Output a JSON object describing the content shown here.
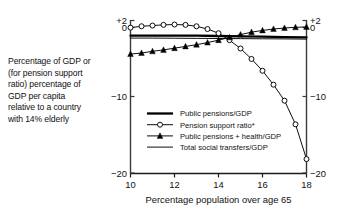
{
  "caption": {
    "lines": [
      "Percentage of GDP or",
      "(for pension support",
      "ratio) percentage of",
      "GDP per capita",
      "relative to a country",
      "with 14% elderly"
    ]
  },
  "chart_data": {
    "type": "line",
    "title": "",
    "subtitle": "",
    "xlabel": "Percentage population over age 65",
    "ylabel": "",
    "left_axis_label": "Percentage of GDP or (for pension support ratio) percentage of GDP per capita relative to a country with 14% elderly",
    "xlim": [
      10,
      18
    ],
    "ylim": [
      -20,
      2
    ],
    "xticks": [
      10,
      12,
      14,
      16,
      18
    ],
    "xtick_labels": [
      "10",
      "12",
      "14",
      "16",
      "18"
    ],
    "yticks": [
      2,
      0,
      -10,
      -20
    ],
    "ytick_labels": [
      "+2",
      "0",
      "−10",
      "−20"
    ],
    "right_axis_mirrors_left": true,
    "grid": false,
    "legend_position": "center-left-inside",
    "series": [
      {
        "name": "Public pensions/GDP",
        "marker": "none",
        "linewidth": "thick",
        "color": "#000000",
        "x": [
          10,
          11,
          12,
          13,
          14,
          15,
          16,
          17,
          18
        ],
        "values": [
          -0.25,
          -0.25,
          -0.25,
          -0.25,
          -0.3,
          -0.35,
          -0.4,
          -0.45,
          -0.5
        ]
      },
      {
        "name": "Pension support ratio*",
        "marker": "open-circle",
        "linewidth": "thin",
        "color": "#000000",
        "x": [
          10,
          10.5,
          11,
          11.5,
          12,
          12.5,
          13,
          13.5,
          14,
          14.5,
          15,
          15.5,
          16,
          16.5,
          17,
          17.5,
          18
        ],
        "values": [
          0.9,
          1.1,
          1.2,
          1.3,
          1.35,
          1.3,
          1.1,
          0.7,
          0.1,
          -0.9,
          -2.1,
          -3.6,
          -5.3,
          -7.3,
          -9.6,
          -13.0,
          -18.0
        ]
      },
      {
        "name": "Public pensions + health/GDP",
        "marker": "filled-triangle",
        "linewidth": "thin",
        "color": "#000000",
        "x": [
          10,
          10.5,
          11,
          11.5,
          12,
          12.5,
          13,
          13.5,
          14,
          14.5,
          15,
          15.5,
          16,
          16.5,
          17,
          17.5,
          18
        ],
        "values": [
          -2.9,
          -2.75,
          -2.5,
          -2.3,
          -2.05,
          -1.8,
          -1.55,
          -1.25,
          -0.9,
          -0.5,
          -0.1,
          0.25,
          0.5,
          0.7,
          0.85,
          0.95,
          1.0
        ]
      },
      {
        "name": "Total social transfers/GDP",
        "marker": "none",
        "linewidth": "thin",
        "color": "#000000",
        "x": [
          10,
          11,
          12,
          13,
          14,
          15,
          16,
          17,
          18
        ],
        "values": [
          -0.6,
          -0.6,
          -0.62,
          -0.64,
          -0.66,
          -0.68,
          -0.7,
          -0.72,
          -0.75
        ]
      }
    ],
    "legend": [
      {
        "label": "Public pensions/GDP",
        "marker": "none",
        "linewidth": "thick"
      },
      {
        "label": "Pension support ratio*",
        "marker": "open-circle",
        "linewidth": "thin"
      },
      {
        "label": "Public pensions + health/GDP",
        "marker": "filled-triangle",
        "linewidth": "thin"
      },
      {
        "label": "Total social transfers/GDP",
        "marker": "none",
        "linewidth": "thin"
      }
    ]
  }
}
